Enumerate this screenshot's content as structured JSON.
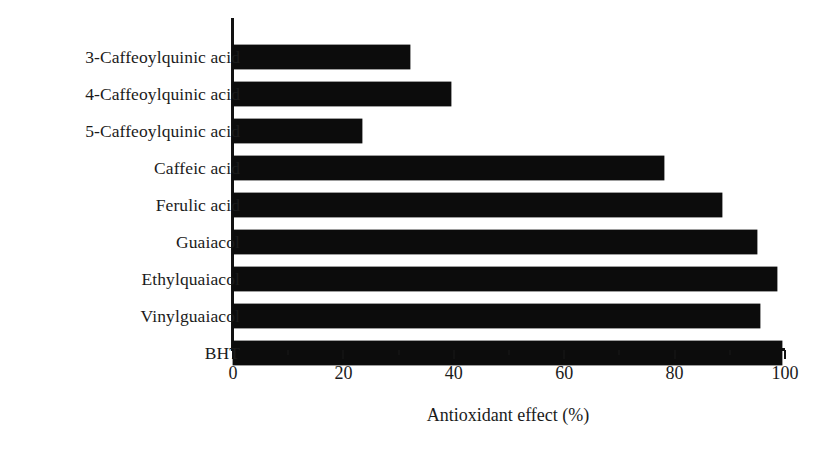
{
  "chart_data": {
    "type": "bar",
    "orientation": "horizontal",
    "title": "",
    "xlabel": "Antioxidant effect (%)",
    "ylabel": "",
    "xlim": [
      0,
      100
    ],
    "grid": false,
    "legend": null,
    "xticks": [
      0,
      20,
      40,
      60,
      80,
      100
    ],
    "xtick_labels": [
      "0",
      "20",
      "40",
      "60",
      "80",
      "100"
    ],
    "minor_xticks": [
      10,
      30,
      50,
      70,
      90
    ],
    "bar_color": "#0c0c0c",
    "background_color": "#ffffff",
    "categories": [
      "3-Caffeoylquinic acid",
      "4-Caffeoylquinic acid",
      "5-Caffeoylquinic acid",
      "Caffeic acid",
      "Ferulic acid",
      "Guaiacol",
      "Ethylquaiacol",
      "Vinylguaiacol",
      "BHT"
    ],
    "values": [
      32,
      39.5,
      23.4,
      78,
      88.5,
      95,
      98.5,
      95.5,
      99.5
    ]
  }
}
